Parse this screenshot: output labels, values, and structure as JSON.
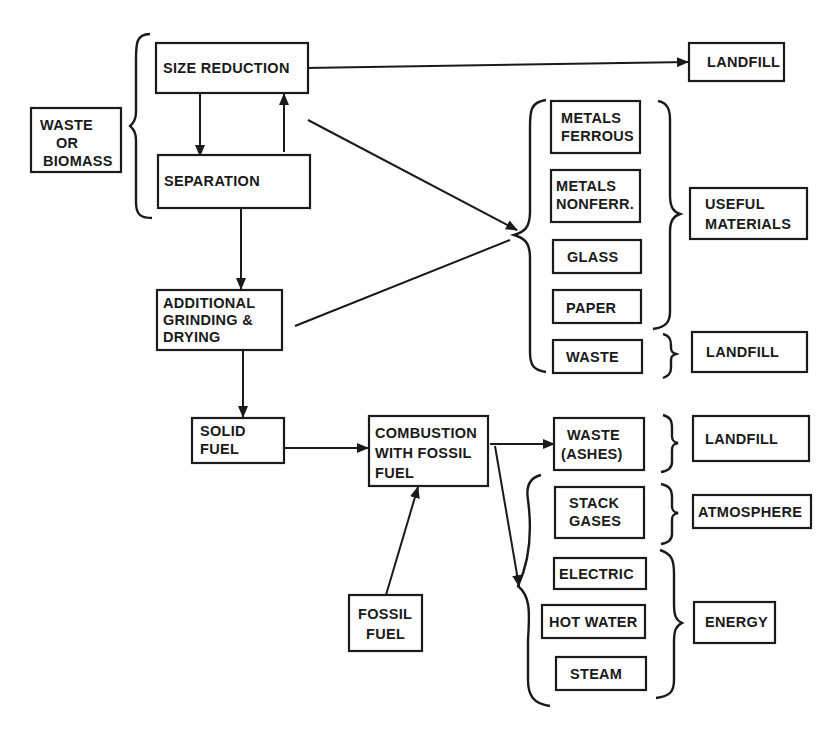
{
  "diagram": {
    "type": "process-flow",
    "nodes": {
      "waste_biomass": {
        "line1": "WASTE",
        "line2": "OR",
        "line3": "BIOMASS"
      },
      "size_reduction": {
        "label": "SIZE REDUCTION"
      },
      "separation": {
        "label": "SEPARATION"
      },
      "additional_grinding": {
        "line1": "ADDITIONAL",
        "line2": "GRINDING &",
        "line3": "DRYING"
      },
      "solid_fuel": {
        "line1": "SOLID",
        "line2": "FUEL"
      },
      "combustion": {
        "line1": "COMBUSTION",
        "line2": "WITH FOSSIL",
        "line3": "FUEL"
      },
      "fossil_fuel": {
        "line1": "FOSSIL",
        "line2": "FUEL"
      },
      "landfill_top": {
        "label": "LANDFILL"
      },
      "metals_ferrous": {
        "line1": "METALS",
        "line2": "FERROUS"
      },
      "metals_nonferrous": {
        "line1": "METALS",
        "line2": "NONFERR."
      },
      "glass": {
        "label": "GLASS"
      },
      "paper": {
        "label": "PAPER"
      },
      "waste_sep": {
        "label": "WASTE"
      },
      "useful_materials": {
        "line1": "USEFUL",
        "line2": "MATERIALS"
      },
      "landfill_mid": {
        "label": "LANDFILL"
      },
      "waste_ashes": {
        "line1": "WASTE",
        "line2": "(ASHES)"
      },
      "landfill_bottom": {
        "label": "LANDFILL"
      },
      "stack_gases": {
        "line1": "STACK",
        "line2": "GASES"
      },
      "atmosphere": {
        "label": "ATMOSPHERE"
      },
      "electric": {
        "label": "ELECTRIC"
      },
      "hot_water": {
        "label": "HOT WATER"
      },
      "steam": {
        "label": "STEAM"
      },
      "energy": {
        "label": "ENERGY"
      }
    },
    "edges": [
      {
        "from": "size_reduction",
        "to": "landfill_top"
      },
      {
        "from": "size_reduction",
        "to": "separation"
      },
      {
        "from": "separation",
        "to": "size_reduction"
      },
      {
        "from": "size_reduction",
        "to": "recovered_materials_group"
      },
      {
        "from": "separation",
        "to": "additional_grinding"
      },
      {
        "from": "additional_grinding",
        "to": "recovered_materials_group"
      },
      {
        "from": "additional_grinding",
        "to": "solid_fuel"
      },
      {
        "from": "solid_fuel",
        "to": "combustion"
      },
      {
        "from": "fossil_fuel",
        "to": "combustion"
      },
      {
        "from": "combustion",
        "to": "waste_ashes"
      },
      {
        "from": "combustion",
        "to": "combustion_outputs_group"
      }
    ]
  }
}
